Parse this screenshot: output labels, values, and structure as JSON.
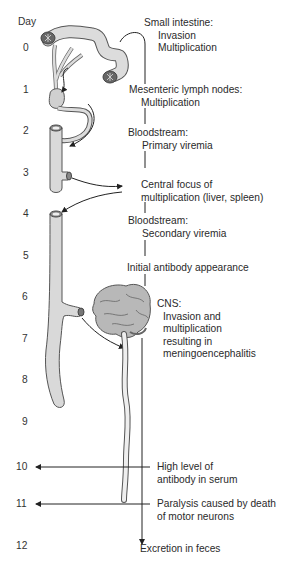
{
  "diagram": {
    "axis_label": "Day",
    "days": [
      "0",
      "1",
      "2",
      "3",
      "4",
      "5",
      "6",
      "7",
      "8",
      "9",
      "10",
      "11",
      "12"
    ],
    "stages": [
      {
        "title": "Small intestine:",
        "lines": [
          "Invasion",
          "Multiplication"
        ]
      },
      {
        "title": "Mesenteric lymph nodes:",
        "lines": [
          "Multiplication"
        ]
      },
      {
        "title": "Bloodstream:",
        "lines": [
          "Primary viremia"
        ]
      },
      {
        "title": "Central focus of",
        "lines": [
          "multiplication (liver, spleen)"
        ]
      },
      {
        "title": "Bloodstream:",
        "lines": [
          "Secondary viremia"
        ]
      },
      {
        "title": "Initial antibody appearance",
        "lines": []
      },
      {
        "title": "CNS:",
        "lines": [
          "Invasion and",
          "multiplication",
          "resulting in",
          "meningoencephalitis"
        ]
      },
      {
        "title": "High level of",
        "lines": [
          "antibody in serum"
        ]
      },
      {
        "title": "Paralysis caused by death",
        "lines": [
          "of motor neurons"
        ]
      },
      {
        "title": "Excretion in feces",
        "lines": []
      }
    ],
    "organs": [
      "small-intestine",
      "mesenteric-lymph-node",
      "blood-vessel-primary",
      "blood-vessel-secondary",
      "brain",
      "spinal-cord"
    ],
    "colors": {
      "organ_fill": "#d9d9d9",
      "organ_stroke": "#555555",
      "brain_fill": "#b8b8b8",
      "line": "#222222"
    }
  }
}
